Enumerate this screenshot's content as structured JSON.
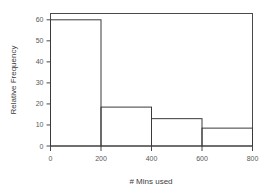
{
  "chart_data": {
    "type": "bar",
    "title": "",
    "subtitle": "",
    "xlabel": "# Mins used",
    "ylabel": "Relative Frequency",
    "categories": [
      "0-200",
      "200-400",
      "400-600",
      "600-800"
    ],
    "bin_edges": [
      0,
      200,
      400,
      600,
      800
    ],
    "values": [
      60,
      18.5,
      13,
      8.5
    ],
    "series": [
      {
        "name": "Relative Frequency",
        "values": [
          60,
          18.5,
          13,
          8.5
        ]
      }
    ],
    "xlim": [
      0,
      800
    ],
    "ylim": [
      0,
      63
    ],
    "xticks": [
      0,
      200,
      400,
      600,
      800
    ],
    "yticks": [
      0,
      10,
      20,
      30,
      40,
      50,
      60
    ],
    "xtick_labels": [
      "0",
      "200",
      "400",
      "600",
      "800"
    ],
    "ytick_labels": [
      "0",
      "10",
      "20",
      "30",
      "40",
      "50",
      "60"
    ],
    "grid": false,
    "legend": false,
    "legend_position": "none",
    "frame": "box",
    "bar_fill": "none",
    "annotations": []
  },
  "colors": {
    "background": "#ffffff",
    "axis": "#4a4a4c",
    "bar_stroke": "#3a3a3c",
    "tick_text": "#58585a",
    "title_text": "#3c3c3e"
  }
}
